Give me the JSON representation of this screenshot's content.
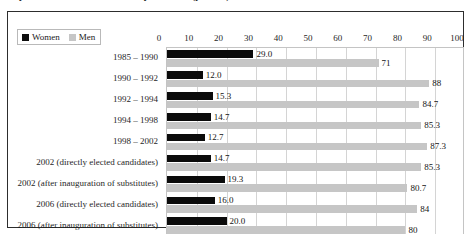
{
  "caption": {
    "text": "Proportion of women and men in parliament (percent)"
  },
  "chart_data": {
    "type": "bar",
    "orientation": "horizontal",
    "title": "",
    "xlabel": "",
    "ylabel": "",
    "xlim": [
      0,
      100
    ],
    "xticks": [
      0,
      10,
      20,
      30,
      40,
      50,
      60,
      70,
      80,
      90,
      100
    ],
    "grid": true,
    "legend_position": "top-left",
    "categories": [
      "1985 – 1990",
      "1990 – 1992",
      "1992 – 1994",
      "1994 – 1998",
      "1998 – 2002",
      "2002 (directly elected candidates)",
      "2002 (after inauguration of substitutes)",
      "2006 (directly elected candidates)",
      "2006 (after inauguration of substitutes)"
    ],
    "series": [
      {
        "name": "Women",
        "color": "#0b0b0b",
        "values": [
          29.0,
          12.0,
          15.3,
          14.7,
          12.7,
          14.7,
          19.3,
          16.0,
          20.0
        ],
        "labels": [
          "29.0",
          "12.0",
          "15.3",
          "14.7",
          "12.7",
          "14.7",
          "19.3",
          "16.0",
          "20.0"
        ]
      },
      {
        "name": "Men",
        "color": "#c6c6c6",
        "values": [
          71,
          88,
          84.7,
          85.3,
          87.3,
          85.3,
          80.7,
          84,
          80
        ],
        "labels": [
          "71",
          "88",
          "84.7",
          "85.3",
          "87.3",
          "85.3",
          "80.7",
          "84",
          "80"
        ]
      }
    ]
  },
  "legend": {
    "items": [
      {
        "label": "Women",
        "swatch": "women-swatch"
      },
      {
        "label": "Men",
        "swatch": "men-swatch"
      }
    ]
  },
  "colors": {
    "women": "#0b0b0b",
    "men": "#c6c6c6",
    "frame": "#2d2d2d",
    "gridline": "#d4d4d4",
    "background": "#ffffff"
  }
}
